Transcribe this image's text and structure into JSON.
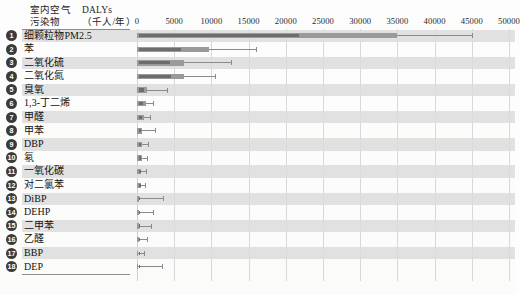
{
  "header": {
    "col1": "室内空气\n污染物",
    "col1_line1": "室内空气",
    "col1_line2": "污染物",
    "col2_line1": "DALYs",
    "col2_line2": "（千人/年）"
  },
  "chart_data": {
    "type": "bar",
    "orientation": "horizontal",
    "title": "",
    "xlabel": "DALYs（千人/年）",
    "ylabel": "室内空气污染物",
    "xlim": [
      0,
      50000
    ],
    "xticks": [
      0,
      5000,
      10000,
      15000,
      20000,
      25000,
      30000,
      35000,
      40000,
      45000,
      50000
    ],
    "xtick_labels": [
      "0",
      "5000",
      "10000",
      "15000",
      "20000",
      "25000",
      "30000",
      "35000",
      "40000",
      "45000",
      "50000"
    ],
    "grid": true,
    "legend": "none",
    "categories": [
      "细颗粒物PM2.5",
      "苯",
      "二氧化硫",
      "二氧化氮",
      "臭氧",
      "1,3-丁二烯",
      "甲醛",
      "甲苯",
      "DBP",
      "氡",
      "一氧化碳",
      "对二氯苯",
      "DiBP",
      "DEHP",
      "二甲苯",
      "乙醛",
      "BBP",
      "DEP"
    ],
    "ranks": [
      "1",
      "2",
      "3",
      "4",
      "5",
      "6",
      "7",
      "8",
      "9",
      "10",
      "11",
      "12",
      "13",
      "14",
      "15",
      "16",
      "17",
      "18"
    ],
    "values": [
      35000,
      9700,
      6300,
      6300,
      1400,
      1150,
      900,
      700,
      680,
      620,
      560,
      520,
      330,
      300,
      280,
      250,
      170,
      140
    ],
    "inner_values": [
      21500,
      5700,
      4200,
      4300,
      700,
      560,
      430,
      330,
      300,
      280,
      260,
      240,
      150,
      140,
      130,
      110,
      80,
      60
    ],
    "error_high": [
      45000,
      16000,
      12600,
      10500,
      4000,
      2100,
      1800,
      2400,
      1500,
      1400,
      1250,
      1100,
      3500,
      2200,
      1900,
      1400,
      900,
      3400
    ],
    "units": "DALYs per 1000 persons per year",
    "colors": {
      "bar": "#9a9a9a",
      "bar_inner": "#6d6d6d",
      "error": "#8a8a8a",
      "stripe": "#dcdcdc",
      "grid": "#d8d8d8"
    }
  }
}
